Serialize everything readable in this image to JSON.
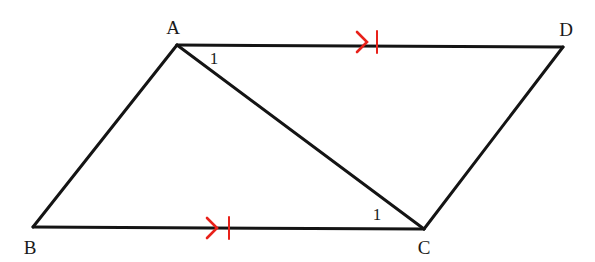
{
  "figure": {
    "kind": "geometry-diagram",
    "background_color": "#ffffff",
    "stroke_color": "#141414",
    "stroke_width": 3,
    "mark_color": "#e8211a",
    "canvas": {
      "width": 595,
      "height": 262
    }
  },
  "vertices": [
    {
      "id": "A",
      "label": "A",
      "x": 177,
      "y": 45,
      "label_x": 173,
      "label_y": 27
    },
    {
      "id": "D",
      "label": "D",
      "x": 563,
      "y": 47,
      "label_x": 566,
      "label_y": 29
    },
    {
      "id": "B",
      "label": "B",
      "x": 33,
      "y": 227,
      "label_x": 30,
      "label_y": 247
    },
    {
      "id": "C",
      "label": "C",
      "x": 424,
      "y": 229,
      "label_x": 424,
      "label_y": 247
    }
  ],
  "segments": [
    {
      "id": "AD",
      "name": "segment-ad",
      "from": "A",
      "to": "D"
    },
    {
      "id": "BC",
      "name": "segment-bc",
      "from": "B",
      "to": "C"
    },
    {
      "id": "AB",
      "name": "segment-ab",
      "from": "A",
      "to": "B"
    },
    {
      "id": "CD",
      "name": "segment-cd",
      "from": "C",
      "to": "D"
    },
    {
      "id": "AC",
      "name": "segment-ac-diagonal",
      "from": "A",
      "to": "C"
    }
  ],
  "marks": [
    {
      "id": "mark-ad",
      "on_segment": "AD",
      "type": "arrow-and-tick",
      "color": "#e8211a",
      "arrow": {
        "x": 357,
        "y": 42,
        "size": 10
      },
      "tick": {
        "x": 377,
        "y": 42,
        "half_height": 11
      }
    },
    {
      "id": "mark-bc",
      "on_segment": "BC",
      "type": "arrow-and-tick",
      "color": "#e8211a",
      "arrow": {
        "x": 207,
        "y": 228,
        "size": 10
      },
      "tick": {
        "x": 229,
        "y": 228,
        "half_height": 11
      }
    }
  ],
  "angle_labels": [
    {
      "id": "angle-1-at-a",
      "text": "1",
      "x": 214,
      "y": 58,
      "at_vertex": "A",
      "between": "AD and AC"
    },
    {
      "id": "angle-1-at-c",
      "text": "1",
      "x": 377,
      "y": 214,
      "at_vertex": "C",
      "between": "CB and CA"
    }
  ]
}
